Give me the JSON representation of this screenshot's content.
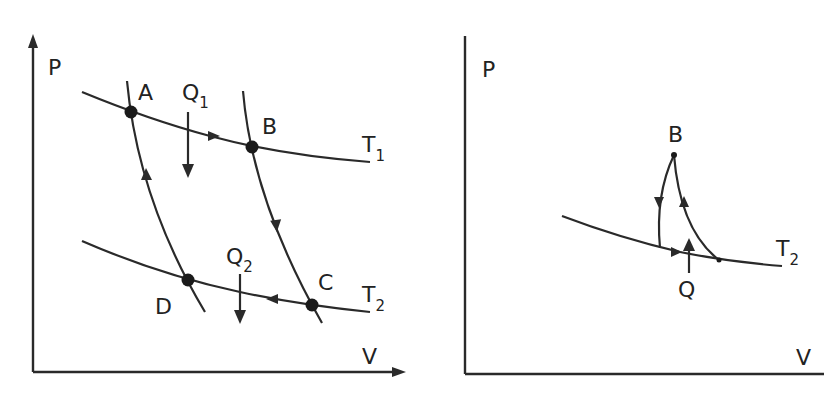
{
  "diagram": {
    "type": "pv-diagram",
    "colors": {
      "line": "#2a2a2a",
      "point": "#1a1a1a",
      "background": "#ffffff"
    },
    "left_panel": {
      "y_axis_label": "P",
      "x_axis_label": "V",
      "points": [
        "A",
        "B",
        "C",
        "D"
      ],
      "isotherms": [
        {
          "label": "T",
          "subscript": "1"
        },
        {
          "label": "T",
          "subscript": "2"
        }
      ],
      "heat_labels": [
        {
          "label": "Q",
          "subscript": "1"
        },
        {
          "label": "Q",
          "subscript": "2"
        }
      ]
    },
    "right_panel": {
      "y_axis_label": "P",
      "x_axis_label": "V",
      "point_label": "B",
      "isotherm": {
        "label": "T",
        "subscript": "2"
      },
      "heat_label": "Q"
    }
  }
}
